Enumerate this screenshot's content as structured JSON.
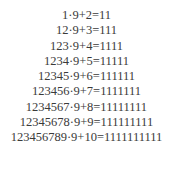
{
  "lines": [
    "1·9+2=11",
    "12·9+3=111",
    "123·9+4=1111",
    "1234·9+5=11111",
    "12345·9+6=111111",
    "123456·9+7=1111111",
    "1234567·9+8=11111111",
    "12345678·9+9=111111111",
    "123456789·9+10=1111111111"
  ]
}
